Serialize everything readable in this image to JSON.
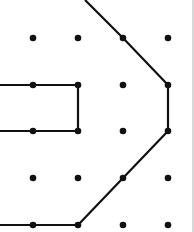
{
  "diagram": {
    "type": "dot-grid-shapes",
    "background": "#ffffff",
    "line_color": "#111111",
    "dot_color": "#111111",
    "grid_x": [
      33,
      78,
      123,
      168
    ],
    "grid_y": [
      38,
      85,
      131,
      178,
      225
    ],
    "polylines": [
      [
        [
          85,
          0
        ],
        [
          123,
          38
        ],
        [
          168,
          85
        ],
        [
          168,
          131
        ],
        [
          123,
          178
        ],
        [
          78,
          225
        ],
        [
          0,
          225
        ]
      ],
      [
        [
          0,
          85
        ],
        [
          78,
          85
        ],
        [
          78,
          131
        ],
        [
          0,
          131
        ]
      ]
    ]
  }
}
